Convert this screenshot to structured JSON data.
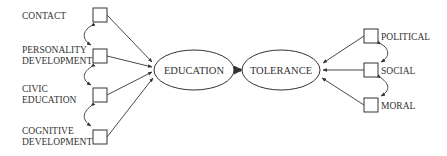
{
  "diagram": {
    "type": "path-model",
    "central_nodes": {
      "education": {
        "label": "EDUCATION",
        "cx": 194,
        "cy": 70,
        "rx": 40,
        "ry": 20
      },
      "tolerance": {
        "label": "TOLERANCE",
        "cx": 281,
        "cy": 70,
        "rx": 39,
        "ry": 20
      }
    },
    "left_indicators": [
      {
        "id": "contact",
        "lines": [
          "CONTACT"
        ],
        "box_x": 93,
        "box_y": 8
      },
      {
        "id": "personality-development",
        "lines": [
          "PERSONALITY",
          "DEVELOPMENT"
        ],
        "box_x": 93,
        "box_y": 49
      },
      {
        "id": "civic-education",
        "lines": [
          "CIVIC",
          "EDUCATION"
        ],
        "box_x": 93,
        "box_y": 88
      },
      {
        "id": "cognitive-development",
        "lines": [
          "COGNITIVE",
          "DEVELOPMENT"
        ],
        "box_x": 93,
        "box_y": 130
      }
    ],
    "right_indicators": [
      {
        "id": "political",
        "lines": [
          "POLITICAL"
        ],
        "box_x": 364,
        "box_y": 29
      },
      {
        "id": "social",
        "lines": [
          "SOCIAL"
        ],
        "box_x": 364,
        "box_y": 63
      },
      {
        "id": "moral",
        "lines": [
          "MORAL"
        ],
        "box_x": 364,
        "box_y": 98
      }
    ],
    "edges": [
      {
        "from": "contact",
        "to": "education"
      },
      {
        "from": "personality-development",
        "to": "education"
      },
      {
        "from": "civic-education",
        "to": "education"
      },
      {
        "from": "cognitive-development",
        "to": "education"
      },
      {
        "from": "education",
        "to": "tolerance",
        "style": "bold"
      },
      {
        "from": "political",
        "to": "tolerance"
      },
      {
        "from": "social",
        "to": "tolerance"
      },
      {
        "from": "moral",
        "to": "tolerance"
      }
    ],
    "correlations": [
      {
        "between": [
          "contact",
          "personality-development"
        ]
      },
      {
        "between": [
          "personality-development",
          "civic-education"
        ]
      },
      {
        "between": [
          "civic-education",
          "cognitive-development"
        ]
      },
      {
        "between": [
          "political",
          "social"
        ]
      },
      {
        "between": [
          "social",
          "moral"
        ]
      }
    ],
    "colors": {
      "stroke": "#333333",
      "background": "#ffffff"
    }
  }
}
